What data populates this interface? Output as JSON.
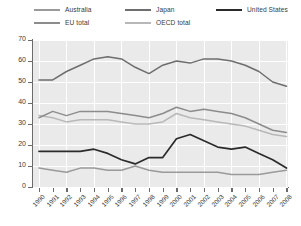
{
  "chart_data": {
    "type": "line",
    "title": "",
    "xlabel": "",
    "ylabel": "",
    "ylim": [
      0,
      70
    ],
    "ytick_step": 10,
    "yticks": [
      "0",
      "10",
      "20",
      "30",
      "40",
      "50",
      "60",
      "70"
    ],
    "grid": true,
    "legend_position": "top",
    "x": [
      "1990",
      "1991",
      "1992",
      "1993",
      "1994",
      "1995",
      "1996",
      "1997",
      "1998",
      "1999",
      "2000",
      "2001",
      "2002",
      "2003",
      "2004",
      "2005",
      "2006",
      "2007",
      "2008"
    ],
    "categories": [
      "1990",
      "1991",
      "1992",
      "1993",
      "1994",
      "1995",
      "1996",
      "1997",
      "1998",
      "1999",
      "2000",
      "2001",
      "2002",
      "2003",
      "2004",
      "2005",
      "2006",
      "2007",
      "2008"
    ],
    "series": [
      {
        "name": "Japan",
        "color": "#6e6e6e",
        "values": [
          51,
          51,
          55,
          58,
          61,
          62,
          61,
          57,
          54,
          58,
          60,
          59,
          61,
          61,
          60,
          58,
          55,
          50,
          48
        ]
      },
      {
        "name": "EU total",
        "color": "#8c8c8c",
        "values": [
          33,
          36,
          34,
          36,
          36,
          36,
          35,
          34,
          33,
          35,
          38,
          36,
          37,
          36,
          35,
          33,
          30,
          27,
          26
        ]
      },
      {
        "name": "OECD total",
        "color": "#b8b8b8",
        "values": [
          34,
          33,
          31,
          32,
          32,
          32,
          31,
          30,
          30,
          31,
          35,
          33,
          32,
          31,
          30,
          29,
          27,
          25,
          24
        ]
      },
      {
        "name": "United States",
        "color": "#2b2b2b",
        "values": [
          17,
          17,
          17,
          17,
          18,
          16,
          13,
          11,
          14,
          14,
          23,
          25,
          22,
          19,
          18,
          19,
          16,
          13,
          9
        ]
      },
      {
        "name": "Australia",
        "color": "#9a9a9a",
        "values": [
          9,
          8,
          7,
          9,
          9,
          8,
          8,
          10,
          8,
          7,
          7,
          7,
          7,
          7,
          6,
          6,
          6,
          7,
          8
        ]
      }
    ],
    "legend": [
      {
        "label": "Australia",
        "color": "#9a9a9a",
        "row": 0,
        "col": 0
      },
      {
        "label": "Japan",
        "color": "#6e6e6e",
        "row": 0,
        "col": 1
      },
      {
        "label": "United States",
        "color": "#2b2b2b",
        "row": 0,
        "col": 2
      },
      {
        "label": "EU total",
        "color": "#8c8c8c",
        "row": 1,
        "col": 0
      },
      {
        "label": "OECD total",
        "color": "#b8b8b8",
        "row": 1,
        "col": 1
      }
    ]
  },
  "colors": {
    "plot_background": "#eaeaea",
    "page_background": "#ffffff",
    "grid": "#ffffff",
    "axis": "#6b6b6b",
    "text": "#3c3c3c"
  }
}
